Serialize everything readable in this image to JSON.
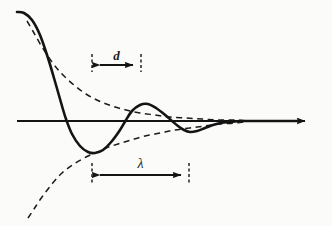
{
  "figure": {
    "background_color": "#fbfbfa",
    "ink_color": "#141414",
    "width": 332,
    "height": 226
  },
  "labels": {
    "d": "d",
    "lambda": "λ"
  },
  "annotations": [
    {
      "name": "d-dimension",
      "label": "d",
      "x_start": 92,
      "x_end": 141,
      "y": 65,
      "tick_top": 54,
      "tick_bottom": 72
    },
    {
      "name": "lambda-dimension",
      "label": "λ",
      "x_start": 92,
      "x_end": 189,
      "y": 175,
      "tick_top": 163,
      "tick_bottom": 184
    }
  ],
  "chart_data": {
    "type": "line",
    "title": "",
    "xlabel": "",
    "ylabel": "",
    "grid": false,
    "legend": null,
    "axis": {
      "name": "horizontal-axis",
      "y": 121,
      "x_start": 17,
      "x_end": 312,
      "arrow_head": true
    },
    "series": [
      {
        "name": "damped-oscillation",
        "style": "solid",
        "points": [
          [
            17,
            12
          ],
          [
            24,
            13
          ],
          [
            32,
            20
          ],
          [
            40,
            35
          ],
          [
            48,
            58
          ],
          [
            56,
            85
          ],
          [
            62,
            106
          ],
          [
            66,
            119
          ],
          [
            72,
            134
          ],
          [
            80,
            146
          ],
          [
            88,
            152
          ],
          [
            95,
            153
          ],
          [
            103,
            150
          ],
          [
            112,
            141
          ],
          [
            120,
            130
          ],
          [
            126,
            120
          ],
          [
            132,
            111
          ],
          [
            140,
            105
          ],
          [
            148,
            104
          ],
          [
            156,
            108
          ],
          [
            164,
            114
          ],
          [
            172,
            121
          ],
          [
            178,
            126
          ],
          [
            184,
            130
          ],
          [
            190,
            132
          ],
          [
            197,
            131
          ],
          [
            205,
            128
          ],
          [
            213,
            125
          ],
          [
            221,
            123
          ],
          [
            230,
            122
          ],
          [
            240,
            121
          ],
          [
            252,
            121
          ],
          [
            270,
            121
          ],
          [
            300,
            121
          ]
        ]
      },
      {
        "name": "upper-envelope",
        "style": "dashed",
        "points": [
          [
            27,
            21
          ],
          [
            34,
            33
          ],
          [
            42,
            47
          ],
          [
            52,
            62
          ],
          [
            62,
            74
          ],
          [
            74,
            85
          ],
          [
            86,
            94
          ],
          [
            99,
            101
          ],
          [
            112,
            106
          ],
          [
            126,
            110
          ],
          [
            140,
            113
          ],
          [
            155,
            115
          ],
          [
            170,
            117
          ],
          [
            186,
            118
          ],
          [
            202,
            119
          ],
          [
            218,
            120
          ],
          [
            234,
            120
          ],
          [
            250,
            121
          ]
        ]
      },
      {
        "name": "lower-envelope",
        "style": "dashed",
        "points": [
          [
            28,
            218
          ],
          [
            34,
            209
          ],
          [
            42,
            197
          ],
          [
            52,
            184
          ],
          [
            62,
            173
          ],
          [
            74,
            164
          ],
          [
            86,
            157
          ],
          [
            95,
            153
          ],
          [
            106,
            148
          ],
          [
            118,
            144
          ],
          [
            131,
            140
          ],
          [
            145,
            136
          ],
          [
            160,
            133
          ],
          [
            175,
            130
          ],
          [
            190,
            128
          ],
          [
            205,
            126
          ],
          [
            220,
            124
          ],
          [
            235,
            123
          ],
          [
            250,
            121
          ]
        ]
      }
    ]
  }
}
